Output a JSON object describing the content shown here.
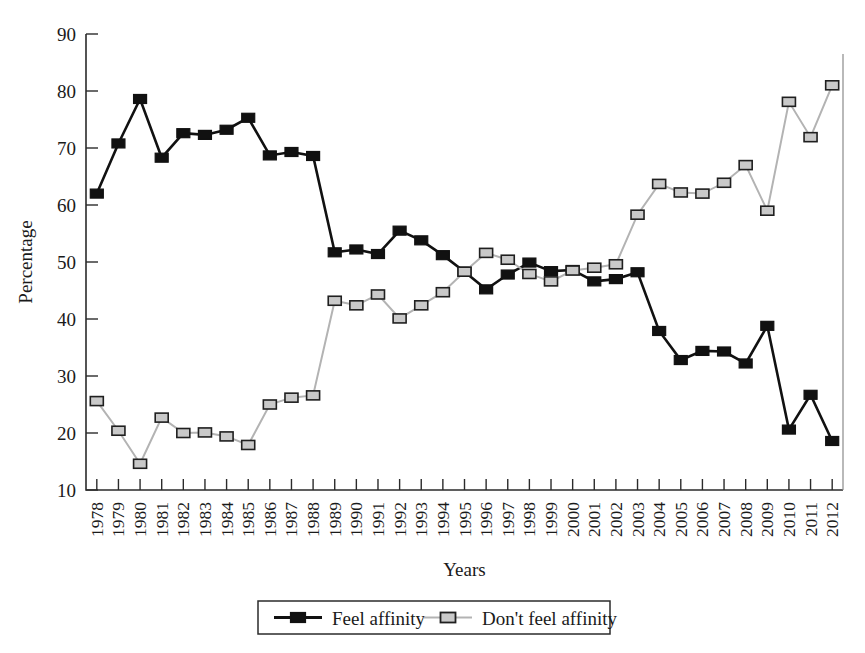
{
  "chart_data": {
    "type": "line",
    "title": "",
    "xlabel": "Years",
    "ylabel": "Percentage",
    "ylim": [
      10,
      90
    ],
    "ytick_step": 10,
    "yticks": [
      10,
      20,
      30,
      40,
      50,
      60,
      70,
      80,
      90
    ],
    "grid": false,
    "legend_position": "bottom-center",
    "categories": [
      "1978",
      "1979",
      "1980",
      "1981",
      "1982",
      "1983",
      "1984",
      "1985",
      "1986",
      "1987",
      "1988",
      "1989",
      "1990",
      "1991",
      "1992",
      "1993",
      "1994",
      "1995",
      "1996",
      "1997",
      "1998",
      "1999",
      "2000",
      "2001",
      "2002",
      "2003",
      "2004",
      "2005",
      "2006",
      "2007",
      "2008",
      "2009",
      "2010",
      "2011",
      "2012"
    ],
    "series": [
      {
        "name": "Feel affinity",
        "color": "#111111",
        "marker": "filled-square",
        "values": [
          62.0,
          70.8,
          78.6,
          68.3,
          72.6,
          72.3,
          73.2,
          75.3,
          68.7,
          69.3,
          68.6,
          51.7,
          52.2,
          51.4,
          55.5,
          53.8,
          51.2,
          48.3,
          45.2,
          47.8,
          49.9,
          48.4,
          48.6,
          46.6,
          47.0,
          48.2,
          37.9,
          32.8,
          34.4,
          34.3,
          32.2,
          38.8,
          20.6,
          26.7,
          18.6
        ]
      },
      {
        "name": "Don't feel affinity",
        "color": "#b3b3b3",
        "marker": "open-square",
        "values": [
          25.6,
          20.4,
          14.6,
          22.7,
          20.0,
          20.1,
          19.4,
          17.9,
          25.0,
          26.2,
          26.6,
          43.2,
          42.4,
          44.3,
          40.1,
          42.4,
          44.7,
          48.3,
          51.6,
          50.4,
          47.9,
          46.6,
          48.5,
          49.0,
          49.6,
          58.3,
          63.7,
          62.2,
          62.0,
          63.9,
          67.0,
          59.0,
          78.1,
          71.9,
          81.0
        ]
      }
    ],
    "legend": [
      {
        "label": "Feel affinity",
        "color": "#111111",
        "marker": "filled-square"
      },
      {
        "label": "Don't feel affinity",
        "color": "#b3b3b3",
        "marker": "open-square"
      }
    ]
  }
}
